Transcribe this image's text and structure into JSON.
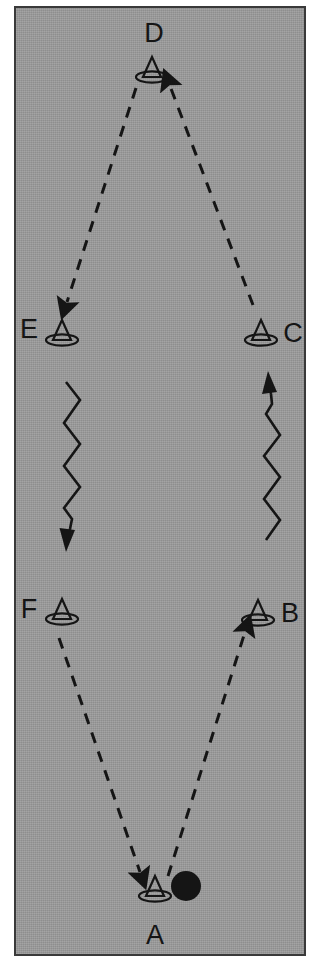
{
  "figure": {
    "type": "cycle-diagram",
    "width": 321,
    "height": 972,
    "background_color": "#ffffff",
    "plate_color": "#9a9a9a",
    "border_color": "#3a3a3a",
    "ink_color": "#151515"
  },
  "nodes": [
    {
      "id": "A",
      "label": "A",
      "x": 155,
      "y": 889,
      "label_x": 155,
      "label_y": 935,
      "marker": "cone-buoy-icon",
      "extra_marker": "filled-circle",
      "extra_x": 185,
      "extra_y": 886
    },
    {
      "id": "B",
      "label": "B",
      "x": 258,
      "y": 613,
      "label_x": 290,
      "label_y": 613,
      "marker": "cone-buoy-icon",
      "extra_marker": null
    },
    {
      "id": "C",
      "label": "C",
      "x": 261,
      "y": 333,
      "label_x": 293,
      "label_y": 333,
      "marker": "cone-buoy-icon",
      "extra_marker": null
    },
    {
      "id": "D",
      "label": "D",
      "x": 152,
      "y": 70,
      "label_x": 154,
      "label_y": 33,
      "marker": "cone-buoy-icon",
      "extra_marker": null
    },
    {
      "id": "E",
      "label": "E",
      "x": 62,
      "y": 333,
      "label_x": 29,
      "label_y": 329,
      "marker": "cone-buoy-icon",
      "extra_marker": null
    },
    {
      "id": "F",
      "label": "F",
      "x": 62,
      "y": 612,
      "label_x": 29,
      "label_y": 609,
      "marker": "cone-buoy-icon",
      "extra_marker": null
    }
  ],
  "edges": [
    {
      "id": "A-to-B",
      "from": "A",
      "to": "B",
      "style": "dashed",
      "arrow": "to",
      "path": "M 168 876 L 245 632",
      "label": ""
    },
    {
      "id": "B-to-C",
      "from": "B",
      "to": "C",
      "style": "zigzag",
      "arrow": "to",
      "label": ""
    },
    {
      "id": "C-to-D",
      "from": "C",
      "to": "D",
      "style": "dashed",
      "arrow": "to",
      "path": "M 253 305 L 170 86",
      "label": ""
    },
    {
      "id": "D-to-E",
      "from": "D",
      "to": "E",
      "style": "dashed",
      "arrow": "to",
      "path": "M 136 88 L 67 302",
      "label": ""
    },
    {
      "id": "E-to-F",
      "from": "E",
      "to": "F",
      "style": "zigzag",
      "arrow": "to",
      "label": ""
    },
    {
      "id": "F-to-A",
      "from": "F",
      "to": "A",
      "style": "dashed",
      "arrow": "to",
      "path": "M 59 638 L 140 872",
      "label": ""
    }
  ],
  "zigzags": [
    {
      "id": "zigzag-E-to-F",
      "direction": "down",
      "points": "66,382 80,400 64,423 80,444 64,466 80,487 64,508 72,519 72,528",
      "arrow_tip": "M 66 548 L 60 527 L 78 527 Z"
    },
    {
      "id": "zigzag-B-to-C",
      "direction": "up",
      "points": "266,540 280,520 264,499 280,477 264,456 280,435 266,414 272,404 272,392",
      "arrow_tip": "M 271 372 L 263 393 L 281 393 Z"
    }
  ],
  "marker_icon": {
    "name": "cone-buoy-icon",
    "description": "triangular cone with elliptical base ring"
  }
}
